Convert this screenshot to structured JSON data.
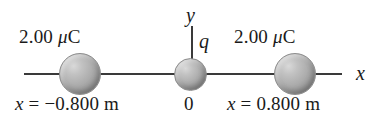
{
  "figure": {
    "background_color": "#ffffff",
    "line_color": "#3a3a3a",
    "sphere_color": "#ababab"
  },
  "axes": {
    "x_label": "x",
    "y_label": "y",
    "origin_label": "0"
  },
  "charges": [
    {
      "id": "left-charge",
      "magnitude_label": "2.00 μC",
      "magnitude_value": 2.0,
      "magnitude_unit": "μC",
      "position_label": "x = −0.800 m",
      "position_value": -0.8,
      "position_unit": "m"
    },
    {
      "id": "center-charge",
      "magnitude_label": "q",
      "position_label": "0",
      "position_value": 0,
      "position_unit": "m"
    },
    {
      "id": "right-charge",
      "magnitude_label": "2.00 μC",
      "magnitude_value": 2.0,
      "magnitude_unit": "μC",
      "position_label": "x = 0.800 m",
      "position_value": 0.8,
      "position_unit": "m"
    }
  ],
  "labels": {
    "charge_left": "2.00 μC",
    "charge_right": "2.00 μC",
    "pos_left": "x = −0.800 m",
    "pos_right": "x = 0.800 m",
    "origin": "0",
    "q": "q",
    "axis_x": "x",
    "axis_y": "y"
  }
}
